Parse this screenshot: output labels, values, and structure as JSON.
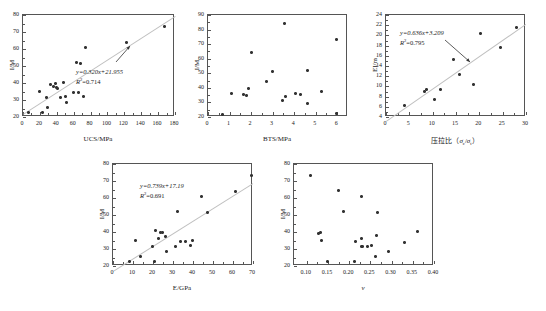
{
  "figure": {
    "panel_count": 5,
    "marker": "asterisk",
    "trend_color": "#c9c9c9",
    "axis_color": "#555555"
  },
  "chart_data": [
    {
      "id": "panel-a",
      "type": "scatter",
      "title": "",
      "xlabel": "UCS/MPa",
      "ylabel": "I/M",
      "xlim": [
        0,
        180
      ],
      "ylim": [
        20,
        80
      ],
      "xticks": [
        0,
        20,
        40,
        60,
        80,
        100,
        120,
        140,
        160,
        180
      ],
      "yticks": [
        20,
        30,
        40,
        50,
        60,
        70,
        80
      ],
      "grid": false,
      "legend": "none",
      "annotation": {
        "equation": "y=0.320x+21.955",
        "r2": "R²=0.714",
        "slope": 0.32,
        "intercept": 21.955,
        "r_squared": 0.714
      },
      "points": [
        [
          7,
          22.5
        ],
        [
          20,
          34.8
        ],
        [
          23,
          22.8
        ],
        [
          28,
          31.5
        ],
        [
          29,
          25.8
        ],
        [
          32,
          39.3
        ],
        [
          36,
          38.0
        ],
        [
          38,
          39.8
        ],
        [
          40,
          37.5
        ],
        [
          41,
          37.0
        ],
        [
          44,
          31.5
        ],
        [
          48,
          40.5
        ],
        [
          50,
          31.8
        ],
        [
          52,
          28.8
        ],
        [
          60,
          34.6
        ],
        [
          63,
          52.0
        ],
        [
          66,
          34.5
        ],
        [
          68,
          51.3
        ],
        [
          72,
          31.8
        ],
        [
          74,
          60.8
        ],
        [
          122,
          63.9
        ],
        [
          167,
          73.0
        ]
      ]
    },
    {
      "id": "panel-b",
      "type": "scatter",
      "title": "",
      "xlabel": "BTS/MPa",
      "ylabel": "I/M",
      "xlim": [
        0,
        6.5
      ],
      "ylim": [
        20,
        90
      ],
      "xticks": [
        0,
        1,
        2,
        3,
        4,
        5,
        6
      ],
      "yticks": [
        20,
        30,
        40,
        50,
        60,
        70,
        80,
        90
      ],
      "grid": false,
      "legend": "none",
      "annotation": null,
      "points": [
        [
          0.65,
          21.8
        ],
        [
          1.1,
          36.2
        ],
        [
          1.65,
          35.1
        ],
        [
          1.8,
          35.0
        ],
        [
          1.9,
          39.3
        ],
        [
          2.0,
          64.2
        ],
        [
          2.7,
          44.6
        ],
        [
          3.0,
          51.2
        ],
        [
          3.45,
          31.5
        ],
        [
          3.55,
          84.3
        ],
        [
          3.6,
          34.0
        ],
        [
          4.05,
          36.2
        ],
        [
          4.3,
          35.7
        ],
        [
          4.6,
          52.0
        ],
        [
          4.6,
          29.2
        ],
        [
          5.25,
          37.6
        ],
        [
          5.95,
          73.0
        ],
        [
          5.95,
          22.6
        ]
      ]
    },
    {
      "id": "panel-c",
      "type": "scatter",
      "title": "",
      "xlabel": "压拉比（σc/σt）",
      "ylabel": "EI/m",
      "xlim": [
        0,
        30
      ],
      "ylim": [
        4,
        24
      ],
      "xticks": [
        0,
        5,
        10,
        15,
        20,
        25,
        30
      ],
      "yticks": [
        4,
        6,
        8,
        10,
        12,
        14,
        16,
        18,
        20,
        22,
        24
      ],
      "grid": false,
      "legend": "none",
      "annotation": {
        "equation": "y=0.636x+3.209",
        "r2": "R²=0.795",
        "slope": 0.636,
        "intercept": 3.209,
        "r_squared": 0.795
      },
      "points": [
        [
          3.9,
          6.3
        ],
        [
          8.2,
          9.0
        ],
        [
          8.6,
          9.4
        ],
        [
          10.3,
          7.5
        ],
        [
          11.7,
          9.4
        ],
        [
          14.4,
          15.2
        ],
        [
          15.8,
          12.4
        ],
        [
          18.7,
          10.4
        ],
        [
          20.2,
          20.4
        ],
        [
          24.5,
          17.7
        ],
        [
          28.0,
          21.6
        ]
      ]
    },
    {
      "id": "panel-d",
      "type": "scatter",
      "title": "",
      "xlabel": "E/GPa",
      "ylabel": "I/M",
      "xlim": [
        0,
        70
      ],
      "ylim": [
        20,
        80
      ],
      "xticks": [
        0,
        10,
        20,
        30,
        40,
        50,
        60,
        70
      ],
      "yticks": [
        20,
        30,
        40,
        50,
        60,
        70,
        80
      ],
      "grid": false,
      "legend": "none",
      "annotation": {
        "equation": "y=0.739x+17.19",
        "r2": "R²=0.691",
        "slope": 0.739,
        "intercept": 17.19,
        "r_squared": 0.691
      },
      "points": [
        [
          8.0,
          22.5
        ],
        [
          11.0,
          34.9
        ],
        [
          13.5,
          25.8
        ],
        [
          19.5,
          31.4
        ],
        [
          20.5,
          22.5
        ],
        [
          21.0,
          40.7
        ],
        [
          22.5,
          36.2
        ],
        [
          23.5,
          39.7
        ],
        [
          24.5,
          39.9
        ],
        [
          26.0,
          37.6
        ],
        [
          26.5,
          28.8
        ],
        [
          31.0,
          31.6
        ],
        [
          32.0,
          52.0
        ],
        [
          33.5,
          34.4
        ],
        [
          36.0,
          34.4
        ],
        [
          38.5,
          31.8
        ],
        [
          39.5,
          34.8
        ],
        [
          44.0,
          60.8
        ],
        [
          47.0,
          51.2
        ],
        [
          61.0,
          63.9
        ],
        [
          69.0,
          73.0
        ]
      ]
    },
    {
      "id": "panel-e",
      "type": "scatter",
      "title": "",
      "xlabel": "ν",
      "ylabel": "I/M",
      "xlim": [
        0.07,
        0.4
      ],
      "ylim": [
        20,
        80
      ],
      "xticks": [
        0.1,
        0.15,
        0.2,
        0.25,
        0.3,
        0.35,
        0.4
      ],
      "xticklabels": [
        "0.10",
        "0.15",
        "0.20",
        "0.25",
        "0.30",
        "0.35",
        "0.40"
      ],
      "yticks": [
        20,
        30,
        40,
        50,
        60,
        70,
        80
      ],
      "grid": false,
      "legend": "none",
      "annotation": null,
      "points": [
        [
          0.108,
          73.2
        ],
        [
          0.128,
          39.4
        ],
        [
          0.133,
          39.9
        ],
        [
          0.134,
          34.9
        ],
        [
          0.148,
          22.4
        ],
        [
          0.174,
          64.2
        ],
        [
          0.186,
          52.0
        ],
        [
          0.213,
          22.5
        ],
        [
          0.215,
          34.6
        ],
        [
          0.228,
          36.2
        ],
        [
          0.228,
          31.4
        ],
        [
          0.23,
          60.9
        ],
        [
          0.232,
          31.3
        ],
        [
          0.244,
          31.7
        ],
        [
          0.252,
          31.8
        ],
        [
          0.262,
          25.6
        ],
        [
          0.265,
          38.0
        ],
        [
          0.266,
          51.2
        ],
        [
          0.293,
          28.8
        ],
        [
          0.33,
          33.9
        ],
        [
          0.362,
          40.5
        ]
      ]
    }
  ]
}
